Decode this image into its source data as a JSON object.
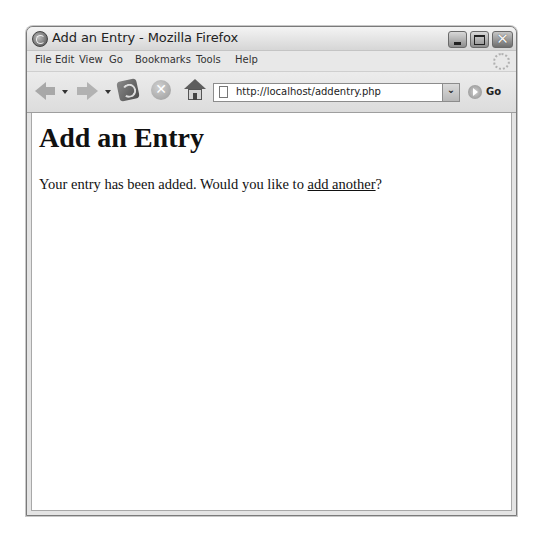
{
  "window": {
    "title": "Add an Entry - Mozilla Firefox",
    "buttons": {
      "minimize_icon": "minimize-icon",
      "maximize_icon": "maximize-icon",
      "close_glyph": "✕"
    }
  },
  "menubar": {
    "items": [
      {
        "label": "File",
        "accel": "F"
      },
      {
        "label": "Edit",
        "accel": "E"
      },
      {
        "label": "View",
        "accel": "V"
      },
      {
        "label": "Go",
        "accel": "G"
      },
      {
        "label": "Bookmarks",
        "accel": "B"
      },
      {
        "label": "Tools",
        "accel": "T"
      },
      {
        "label": "Help",
        "accel": "H"
      }
    ]
  },
  "toolbar": {
    "back_icon": "back-arrow-icon",
    "forward_icon": "forward-arrow-icon",
    "reload_icon": "reload-icon",
    "stop_glyph": "✕",
    "home_icon": "home-icon",
    "url": "http://localhost/addentry.php",
    "dropdown_glyph": "⌄",
    "go_label": "Go"
  },
  "page": {
    "heading": "Add an Entry",
    "message_before": "Your entry has been added. Would you like to ",
    "link_text": "add another",
    "message_after": "?"
  }
}
